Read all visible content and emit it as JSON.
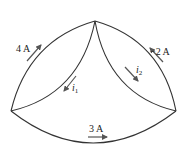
{
  "diagram": {
    "type": "circuit-branch-currents",
    "nodes": [
      {
        "id": "top",
        "x": 95,
        "y": 21
      },
      {
        "id": "left",
        "x": 11,
        "y": 111
      },
      {
        "id": "right",
        "x": 176,
        "y": 111
      }
    ],
    "branches": [
      {
        "id": "outer-left",
        "from": "left",
        "to": "top",
        "current": "4 A",
        "direction": "toward top"
      },
      {
        "id": "inner-left",
        "from": "top",
        "to": "left",
        "current_symbol": "i",
        "current_sub": "1",
        "direction": "toward left"
      },
      {
        "id": "inner-right",
        "from": "top",
        "to": "right",
        "current_symbol": "i",
        "current_sub": "2",
        "direction": "toward right"
      },
      {
        "id": "outer-right",
        "from": "right",
        "to": "top",
        "current": "−2 A",
        "direction": "toward top"
      },
      {
        "id": "bottom",
        "from": "left",
        "to": "right",
        "current": "3 A",
        "direction": "toward right"
      }
    ],
    "labels": {
      "outer_left": "4 A",
      "outer_right": "−2 A",
      "bottom": "3 A",
      "i1_symbol": "i",
      "i1_sub": "1",
      "i2_symbol": "i",
      "i2_sub": "2"
    }
  }
}
